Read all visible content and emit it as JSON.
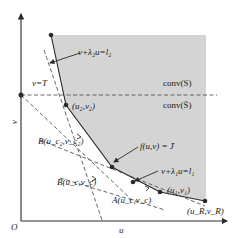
{
  "figure": {
    "axes": {
      "origin_label": "O",
      "x_label": "u",
      "y_label": "v"
    },
    "regions": {
      "upper_label": "conv(S)",
      "lower_label": "conv(S̄)"
    },
    "lines": {
      "v_T": "v=T",
      "line2": "v+λ₂u=l₂",
      "line1": "v+λ₁u=l₁",
      "level_set": "f(u,v) = J̄"
    },
    "points": {
      "p2": "(u₂,v₂)",
      "p1": "(u₁,v₁)",
      "pR": "(u_R,v_R)",
      "B2": "B(u_c₂,v_c₂)",
      "B": "B(u_c,v_c)",
      "A": "A(u_c,v_c)"
    },
    "colors": {
      "shade": "#d4d4d4",
      "ink": "#2a2a2a",
      "dash": "#555555"
    }
  }
}
